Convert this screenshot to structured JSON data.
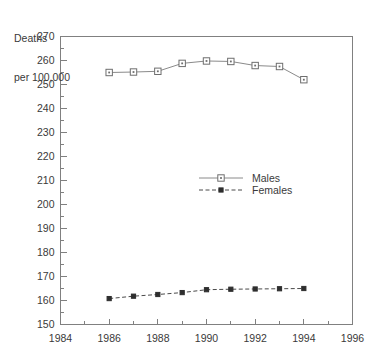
{
  "chart_data": {
    "type": "line",
    "title": "",
    "ylabel": "Deaths\nper 100,000",
    "ylabel_line1": "Deaths",
    "ylabel_line2": "per 100,000",
    "xlabel": "",
    "xlim": [
      1984,
      1996
    ],
    "ylim": [
      150,
      270
    ],
    "y_major_step": 10,
    "y_minor_step": 5,
    "x_major_step": 2,
    "x_minor_step": 1,
    "grid": false,
    "legend_position": "center",
    "yticks": [
      150,
      160,
      170,
      180,
      190,
      200,
      210,
      220,
      230,
      240,
      250,
      260,
      270
    ],
    "ytick_labels": [
      "150",
      "160",
      "170",
      "180",
      "190",
      "200",
      "210",
      "220",
      "230",
      "240",
      "250",
      "260",
      "270"
    ],
    "xticks": [
      1984,
      1986,
      1988,
      1990,
      1992,
      1994,
      1996
    ],
    "xtick_labels": [
      "1984",
      "1986",
      "1988",
      "1990",
      "1992",
      "1994",
      "1996"
    ],
    "x": [
      1986,
      1987,
      1988,
      1989,
      1990,
      1991,
      1992,
      1993,
      1994
    ],
    "series": [
      {
        "name": "Males",
        "marker": "open-square",
        "linestyle": "solid",
        "color": "#6e6e6e",
        "values": [
          255.0,
          255.2,
          255.5,
          258.8,
          259.8,
          259.6,
          257.9,
          257.5,
          252.0
        ]
      },
      {
        "name": "Females",
        "marker": "filled-square",
        "linestyle": "dashed",
        "color": "#2e2e2e",
        "values": [
          160.8,
          161.8,
          162.5,
          163.3,
          164.5,
          164.7,
          164.8,
          164.9,
          165.0
        ]
      }
    ],
    "legend": [
      {
        "label": "Males",
        "marker": "open-square",
        "linestyle": "solid"
      },
      {
        "label": "Females",
        "marker": "filled-square",
        "linestyle": "dashed"
      }
    ]
  }
}
